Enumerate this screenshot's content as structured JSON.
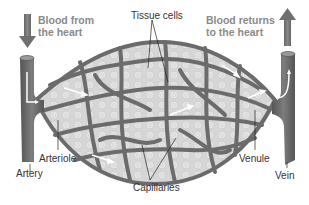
{
  "diagram": {
    "colors": {
      "vessel": "#6e6e6e",
      "vessel_dark": "#555555",
      "vessel_light": "#8a8a8a",
      "tissue": "#d9d9d9",
      "arrow_flow": "#ffffff",
      "heading_text": "#8a8a8a",
      "label_text": "#333333"
    },
    "labels": {
      "blood_from": [
        "Blood from",
        "the heart"
      ],
      "blood_returns": [
        "Blood returns",
        "to the heart"
      ],
      "tissue_cells": "Tissue cells",
      "arteriole": "Arteriole",
      "artery": "Artery",
      "capillaries": "Capillaries",
      "venule": "Venule",
      "vein": "Vein"
    },
    "nodes": [
      {
        "id": "artery",
        "label": "Artery"
      },
      {
        "id": "arteriole",
        "label": "Arteriole"
      },
      {
        "id": "capillaries",
        "label": "Capillaries"
      },
      {
        "id": "venule",
        "label": "Venule"
      },
      {
        "id": "vein",
        "label": "Vein"
      },
      {
        "id": "tissue-cells",
        "label": "Tissue cells"
      }
    ],
    "edges": [
      {
        "from": "artery",
        "to": "arteriole",
        "label": "blood flow"
      },
      {
        "from": "arteriole",
        "to": "capillaries",
        "label": "blood flow"
      },
      {
        "from": "capillaries",
        "to": "venule",
        "label": "blood flow"
      },
      {
        "from": "venule",
        "to": "vein",
        "label": "blood flow"
      }
    ]
  }
}
